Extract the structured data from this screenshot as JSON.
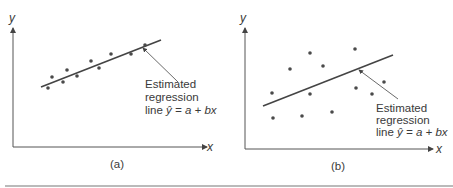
{
  "panels": [
    {
      "caption": "(a)",
      "x_label": "x",
      "y_label": "y",
      "annotation": {
        "line1": "Estimated",
        "line2": "regression",
        "line3_prefix": "line ",
        "line3_yhat": "ŷ",
        "line3_eq": " = a + bx"
      }
    },
    {
      "caption": "(b)",
      "x_label": "x",
      "y_label": "y",
      "annotation": {
        "line1": "Estimated",
        "line2": "regression",
        "line3_prefix": "line ",
        "line3_yhat": "ŷ",
        "line3_eq": " = a + bx"
      }
    }
  ],
  "colors": {
    "ink": "#3a3a3a",
    "dot": "#4a4a4a",
    "axis": "#555555"
  }
}
